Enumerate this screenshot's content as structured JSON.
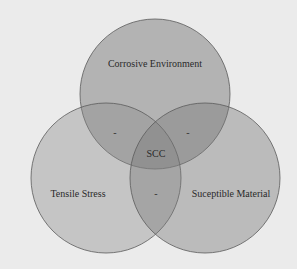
{
  "diagram": {
    "type": "venn",
    "colors": {
      "background": "#ebebeb",
      "circle_fill": "#6e6e6e",
      "circle_stroke": "#555555"
    },
    "sets": [
      {
        "id": "top",
        "label": "Corrosive Environment",
        "cx": 155,
        "cy": 94,
        "r": 75
      },
      {
        "id": "left",
        "label": "Tensile Stress",
        "cx": 106,
        "cy": 178,
        "r": 75
      },
      {
        "id": "right",
        "label": "Suceptible Material",
        "cx": 205,
        "cy": 178,
        "r": 75
      }
    ],
    "intersections": {
      "top_left": "-",
      "top_right": "-",
      "left_right": "-",
      "center": "SCC"
    }
  }
}
